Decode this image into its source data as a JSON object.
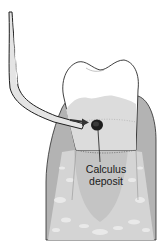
{
  "diagram": {
    "labels": {
      "calculus_line1": "Calculus",
      "calculus_line2": "deposit"
    },
    "colors": {
      "background": "#ffffff",
      "outline": "#2a2a2a",
      "gingiva": "#b8b8b8",
      "gingiva_dark": "#a6a6a6",
      "crown": "#ffffff",
      "crown_shade": "#d8d8d8",
      "root": "#e2e2e2",
      "bone": "#cfcfcf",
      "bone_light": "#ececec",
      "calculus": "#1e1e1e",
      "instrument_fill": "#e6e6e6",
      "arrow": "#333333"
    }
  }
}
